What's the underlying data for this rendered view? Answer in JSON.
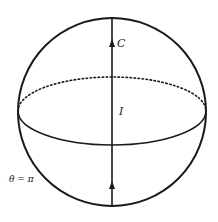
{
  "diagram": {
    "type": "sphere-with-axis",
    "colors": {
      "stroke": "#1a1a1a",
      "background": "#ffffff"
    },
    "sphere": {
      "cx": 112,
      "cy": 112,
      "r": 94
    },
    "equator": {
      "cx": 112,
      "cy": 111,
      "rx": 94,
      "ry": 34,
      "front": "solid",
      "back": "dotted"
    },
    "axis": {
      "x": 112,
      "y_top": 18,
      "y_bottom": 206,
      "arrow_positions": [
        43,
        185
      ],
      "arrow_direction": "up"
    },
    "labels": {
      "curve": "C",
      "current": "I",
      "angle": "θ = π"
    }
  }
}
